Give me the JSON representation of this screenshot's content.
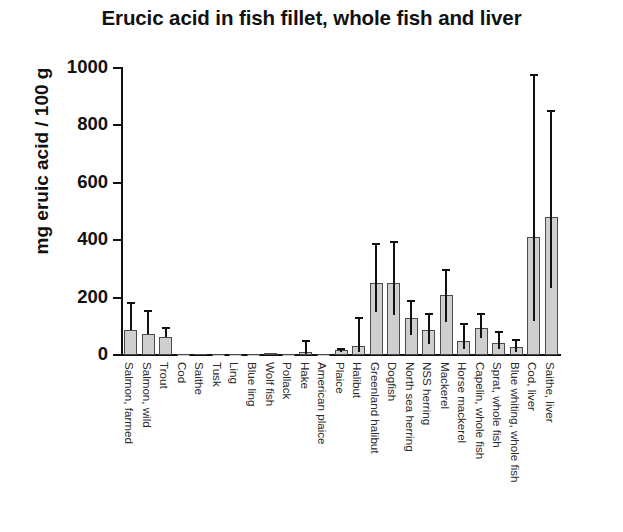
{
  "chart_data": {
    "type": "bar",
    "title": "Erucic acid in fish fillet, whole fish and liver",
    "xlabel": "",
    "ylabel": "mg eruic acid / 100 g",
    "ylim": [
      0,
      1000
    ],
    "yticks": [
      0,
      200,
      400,
      600,
      800,
      1000
    ],
    "ytick_labels": [
      "0",
      "200",
      "400",
      "600",
      "800",
      "1000"
    ],
    "grid": false,
    "legend": null,
    "error_bars": "asymmetric whiskers (min/max range)",
    "bar_color": "#cfcfcf",
    "bar_edge_color": "#4a4a4a",
    "error_bar_color": "#111111",
    "axis_color": "#111111",
    "categories": [
      "Salmon, farmed",
      "Salmon, wild",
      "Trout",
      "Cod",
      "Saithe",
      "Tusk",
      "Ling",
      "Blue ling",
      "Wolf fish",
      "Pollack",
      "Hake",
      "American plaice",
      "Plaice",
      "Halibut",
      "Greenland halibut",
      "Dogfish",
      "North sea herring",
      "NSS herring",
      "Mackerel",
      "Horse mackerel",
      "Capelin, whole fish",
      "Sprat, whole fish",
      "Blue whiting, whole fish",
      "Cod, liver",
      "Saithe, liver"
    ],
    "values": [
      88,
      72,
      62,
      3,
      4,
      2,
      2,
      2,
      6,
      3,
      12,
      3,
      18,
      30,
      250,
      250,
      130,
      88,
      210,
      48,
      95,
      42,
      28,
      410,
      480
    ],
    "err_low": [
      88,
      72,
      62,
      3,
      4,
      2,
      2,
      2,
      6,
      3,
      4,
      3,
      10,
      12,
      150,
      140,
      70,
      40,
      115,
      20,
      58,
      20,
      12,
      120,
      235
    ],
    "err_high": [
      185,
      157,
      97,
      6,
      7,
      3,
      3,
      3,
      9,
      5,
      52,
      5,
      25,
      132,
      390,
      398,
      190,
      148,
      300,
      112,
      148,
      82,
      55,
      980,
      852
    ],
    "series": [
      {
        "name": "Erucic acid content",
        "values": [
          88,
          72,
          62,
          3,
          4,
          2,
          2,
          2,
          6,
          3,
          12,
          3,
          18,
          30,
          250,
          250,
          130,
          88,
          210,
          48,
          95,
          42,
          28,
          410,
          480
        ]
      }
    ]
  }
}
